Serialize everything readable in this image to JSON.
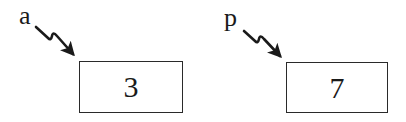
{
  "diagram": {
    "type": "pointer-reference-diagram",
    "nodes": [
      {
        "id": "a",
        "label": "a",
        "value": "3",
        "arrow_style": "zigzag-pointer",
        "stroke_color": "#1a1a1a"
      },
      {
        "id": "p",
        "label": "p",
        "value": "7",
        "arrow_style": "zigzag-pointer",
        "stroke_color": "#1a1a1a"
      }
    ]
  }
}
